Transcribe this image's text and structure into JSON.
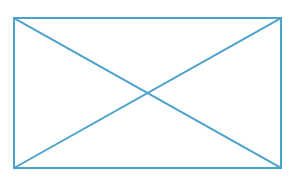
{
  "canvas": {
    "width": 303,
    "height": 183,
    "background_color": "#ffffff"
  },
  "placeholder_graphic": {
    "kind": "image-placeholder",
    "description": "Rectangle outline with two crossing diagonals",
    "stroke_color": "#4ba3cc",
    "stroke_width": 2,
    "fill_color": "none",
    "rect": {
      "x": 14,
      "y": 18,
      "width": 267,
      "height": 150,
      "left": 14,
      "top": 18,
      "right": 281,
      "bottom": 168
    },
    "center": {
      "x": 147.5,
      "y": 93
    },
    "diagonals": [
      {
        "name": "diagonal-top-left-to-bottom-right",
        "x1": 14,
        "y1": 18,
        "x2": 281,
        "y2": 168
      },
      {
        "name": "diagonal-bottom-left-to-top-right",
        "x1": 14,
        "y1": 168,
        "x2": 281,
        "y2": 18
      }
    ],
    "edges": [
      {
        "name": "top-edge",
        "x1": 14,
        "y1": 18,
        "x2": 281,
        "y2": 18
      },
      {
        "name": "right-edge",
        "x1": 281,
        "y1": 18,
        "x2": 281,
        "y2": 168
      },
      {
        "name": "bottom-edge",
        "x1": 281,
        "y1": 168,
        "x2": 14,
        "y2": 168
      },
      {
        "name": "left-edge",
        "x1": 14,
        "y1": 168,
        "x2": 14,
        "y2": 18
      }
    ],
    "label_text": ""
  }
}
